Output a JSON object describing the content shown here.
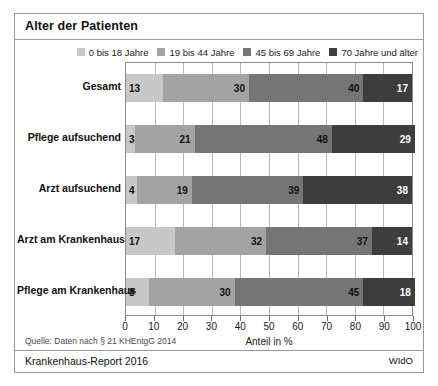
{
  "title": "Alter der Patienten",
  "footer": {
    "source_note": "Quelle: Daten nach § 21 KHEntgG 2014",
    "report": "Krankenhaus-Report 2016",
    "publisher": "WIdO"
  },
  "chart_data": {
    "type": "bar",
    "orientation": "horizontal",
    "stacked": true,
    "stack_mode": "percent",
    "title": "Alter der Patienten",
    "xlabel": "Anteil in %",
    "ylabel": "",
    "xlim": [
      0,
      100
    ],
    "xticks": [
      0,
      10,
      20,
      30,
      40,
      50,
      60,
      70,
      80,
      90,
      100
    ],
    "grid": true,
    "legend_position": "top-right",
    "categories": [
      "Gesamt",
      "Pflege aufsuchend",
      "Arzt aufsuchend",
      "Arzt am Krankenhaus",
      "Pflege am Krankenhaus"
    ],
    "series": [
      {
        "name": "0 bis 18 Jahre",
        "color": "#c8c8c8",
        "values": [
          13,
          3,
          4,
          17,
          8
        ]
      },
      {
        "name": "19 bis 44 Jahre",
        "color": "#a3a3a3",
        "values": [
          30,
          21,
          19,
          32,
          30
        ]
      },
      {
        "name": "45 bis 69 Jahre",
        "color": "#757575",
        "values": [
          40,
          48,
          39,
          37,
          45
        ]
      },
      {
        "name": "70 Jahre und älter",
        "color": "#3d3d3d",
        "values": [
          17,
          29,
          38,
          14,
          18
        ]
      }
    ]
  }
}
